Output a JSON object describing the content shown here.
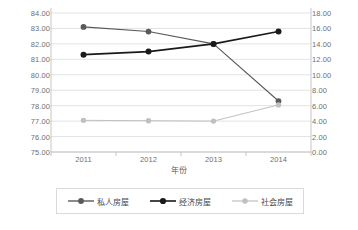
{
  "chart_data": {
    "type": "line",
    "title": "",
    "xlabel": "年份",
    "ylabel": "",
    "categories": [
      "2011",
      "2012",
      "2013",
      "2014"
    ],
    "grid": true,
    "legend_position": "bottom",
    "axes": {
      "left": {
        "min": 75.0,
        "max": 84.0,
        "step": 1.0,
        "ticks": [
          "75.00",
          "76.00",
          "77.00",
          "78.00",
          "79.00",
          "80.00",
          "81.00",
          "82.00",
          "83.00",
          "84.00"
        ]
      },
      "right": {
        "min": 0.0,
        "max": 18.0,
        "step": 2.0,
        "ticks": [
          "0.00",
          "2.00",
          "4.00",
          "6.00",
          "8.00",
          "10.00",
          "12.00",
          "14.00",
          "16.00",
          "18.00"
        ]
      }
    },
    "series": [
      {
        "name": "私人房屋",
        "axis": "left",
        "color": "#595959",
        "marker": "circle",
        "values": [
          83.1,
          82.8,
          82.0,
          78.3
        ]
      },
      {
        "name": "经济房屋",
        "axis": "left",
        "color": "#1a1a1a",
        "marker": "circle",
        "values": [
          81.3,
          81.5,
          82.0,
          82.8
        ]
      },
      {
        "name": "社会房屋",
        "axis": "right",
        "color": "#c0c0c0",
        "marker": "circle",
        "values": [
          4.1,
          4.05,
          4.0,
          6.1
        ]
      }
    ]
  },
  "legend": {
    "items": [
      {
        "label": "私人房屋",
        "color": "#595959"
      },
      {
        "label": "经济房屋",
        "color": "#1a1a1a"
      },
      {
        "label": "社会房屋",
        "color": "#c0c0c0"
      }
    ]
  },
  "colors": {
    "gridline": "#dcdcdc",
    "axis": "#bfbfbf",
    "tick_text": "#6f6f6f",
    "background": "#ffffff",
    "legend_border": "#d9d9d9"
  }
}
